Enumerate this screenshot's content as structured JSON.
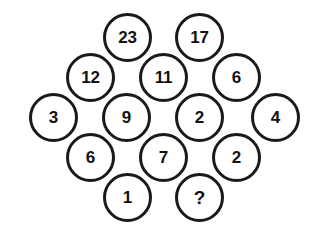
{
  "figure": {
    "kind": "number-circle-puzzle",
    "background_color": "#ffffff",
    "circle_fill": "#ffffff",
    "circle_stroke": "#1a1a1a",
    "text_color": "#111111",
    "circle_diameter": 49,
    "stroke_width": 3,
    "unknown_symbol": "?"
  },
  "chart_data": {
    "type": "diagram",
    "title": "",
    "nodes": [
      {
        "id": "n1",
        "label": "23",
        "row": 1,
        "col": 1,
        "x": 103,
        "y": 13
      },
      {
        "id": "n2",
        "label": "17",
        "row": 1,
        "col": 2,
        "x": 175,
        "y": 13
      },
      {
        "id": "n3",
        "label": "12",
        "row": 2,
        "col": 1,
        "x": 66,
        "y": 53
      },
      {
        "id": "n4",
        "label": "11",
        "row": 2,
        "col": 2,
        "x": 139,
        "y": 53
      },
      {
        "id": "n5",
        "label": "6",
        "row": 2,
        "col": 3,
        "x": 212,
        "y": 53
      },
      {
        "id": "n6",
        "label": "3",
        "row": 3,
        "col": 1,
        "x": 29,
        "y": 93
      },
      {
        "id": "n7",
        "label": "9",
        "row": 3,
        "col": 2,
        "x": 102,
        "y": 93
      },
      {
        "id": "n8",
        "label": "2",
        "row": 3,
        "col": 3,
        "x": 175,
        "y": 93
      },
      {
        "id": "n9",
        "label": "4",
        "row": 3,
        "col": 4,
        "x": 251,
        "y": 93
      },
      {
        "id": "n10",
        "label": "6",
        "row": 4,
        "col": 1,
        "x": 66,
        "y": 133
      },
      {
        "id": "n11",
        "label": "7",
        "row": 4,
        "col": 2,
        "x": 139,
        "y": 133
      },
      {
        "id": "n12",
        "label": "2",
        "row": 4,
        "col": 3,
        "x": 212,
        "y": 133
      },
      {
        "id": "n13",
        "label": "1",
        "row": 5,
        "col": 1,
        "x": 103,
        "y": 173
      },
      {
        "id": "n14",
        "label": "?",
        "row": 5,
        "col": 2,
        "x": 175,
        "y": 173
      }
    ],
    "rows": [
      {
        "row": 1,
        "labels": [
          "23",
          "17"
        ]
      },
      {
        "row": 2,
        "labels": [
          "12",
          "11",
          "6"
        ]
      },
      {
        "row": 3,
        "labels": [
          "3",
          "9",
          "2",
          "4"
        ]
      },
      {
        "row": 4,
        "labels": [
          "6",
          "7",
          "2"
        ]
      },
      {
        "row": 5,
        "labels": [
          "1",
          "?"
        ]
      }
    ]
  }
}
